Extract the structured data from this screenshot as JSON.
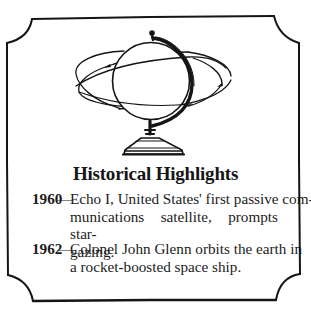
{
  "illustration": {
    "subject": "globe-with-orbits",
    "stroke_color": "#151515",
    "background_color": "#ffffff"
  },
  "frame": {
    "style": "scalloped-corner-border",
    "stroke_color": "#151515"
  },
  "title": "Historical Highlights",
  "entries": [
    {
      "year": "1960",
      "dash": "—",
      "lines": [
        "Echo I, United States' first passive com-",
        "munications satellite, prompts star-",
        "gazing."
      ]
    },
    {
      "year": "1962",
      "dash": "—",
      "lines": [
        "Colonel John Glenn orbits the earth in",
        "a rocket-boosted space ship."
      ]
    }
  ]
}
